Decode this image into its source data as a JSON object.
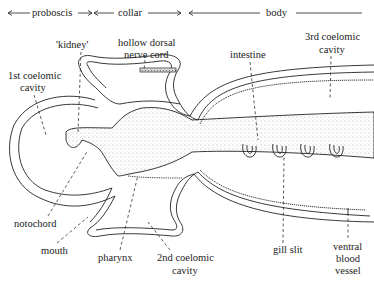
{
  "regions": {
    "proboscis": "proboscis",
    "collar": "collar",
    "body": "body"
  },
  "labels": {
    "kidney": "'kidney'",
    "nerve_cord_1": "hollow dorsal",
    "nerve_cord_2": "nerve cord",
    "coelom1_1": "1st coelomic",
    "coelom1_2": "cavity",
    "intestine": "intestine",
    "coelom3_1": "3rd coelomic",
    "coelom3_2": "cavity",
    "notochord": "notochord",
    "mouth": "mouth",
    "pharynx": "pharynx",
    "coelom2_1": "2nd coelomic",
    "coelom2_2": "cavity",
    "gill_slit": "gill slit",
    "vbv_1": "ventral",
    "vbv_2": "blood",
    "vbv_3": "vessel"
  },
  "gill_slit_count": 4,
  "colors": {
    "ink": "#222222",
    "background": "#ffffff"
  }
}
